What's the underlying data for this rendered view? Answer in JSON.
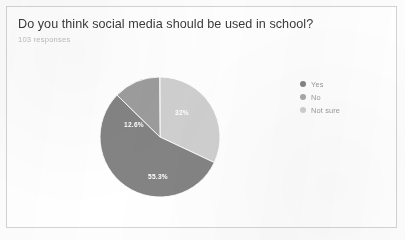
{
  "card": {
    "question": "Do you think social media should be used in school?",
    "response_count_label": "103 responses"
  },
  "legend": {
    "items": [
      {
        "label": "Yes",
        "color": "#848484",
        "icon": "legend-dot-icon"
      },
      {
        "label": "No",
        "color": "#a9a9a9",
        "icon": "legend-dot-icon"
      },
      {
        "label": "Not sure",
        "color": "#d0d0d0",
        "icon": "legend-dot-icon"
      }
    ]
  },
  "chart_data": {
    "type": "pie",
    "title": "Do you think social media should be used in school?",
    "subtitle": "103 responses",
    "labels": [
      "Yes",
      "No",
      "Not sure"
    ],
    "values": [
      55.3,
      32.0,
      12.6
    ],
    "value_labels": [
      "55.3%",
      "32%",
      "12.6%"
    ],
    "colors": [
      "#848484",
      "#d0d0d0",
      "#9d9d9d"
    ],
    "legend_position": "right",
    "grid": false,
    "start_angle_deg": 0,
    "direction": "clockwise",
    "slice_order_from_top_clockwise": [
      "No",
      "Yes",
      "Not sure"
    ]
  },
  "geometry": {
    "pie_cx": 62,
    "pie_cy": 62,
    "pie_r": 60,
    "label_no": {
      "x": 84,
      "y": 40
    },
    "label_yes": {
      "x": 60,
      "y": 104
    },
    "label_not_sure": {
      "x": 36,
      "y": 52
    }
  },
  "colors": {
    "card_border": "#d3d3d3",
    "title_text": "#3b3b3b",
    "subtitle_text": "#bdbdbd",
    "legend_text": "#9a9a9a",
    "page_background": "#fdfdfd"
  }
}
